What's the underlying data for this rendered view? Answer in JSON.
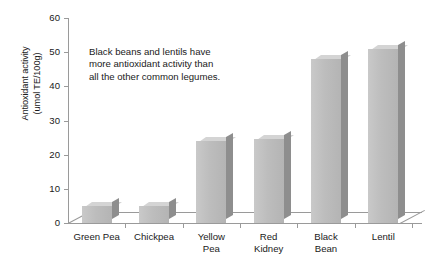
{
  "chart_data": {
    "type": "bar",
    "title": "",
    "xlabel": "",
    "ylabel": "Antioxidant activity\n(umol TE/100g)",
    "categories": [
      "Green Pea",
      "Chickpea",
      "Yellow\nPea",
      "Red\nKidney",
      "Black\nBean",
      "Lentil"
    ],
    "values": [
      5,
      5,
      24,
      24.5,
      48,
      51
    ],
    "ylim": [
      0,
      60
    ],
    "yticks": [
      0,
      10,
      20,
      30,
      40,
      50,
      60
    ],
    "ytick_labels": [
      "0",
      "10",
      "20",
      "30",
      "40",
      "50",
      "60"
    ],
    "grid": false,
    "legend": "none",
    "annotations": [
      "Black beans and lentils have\nmore antioxidant activity than\nall the other common legumes."
    ],
    "style": {
      "bar_face_color": "#bdbdbd",
      "bar_top_color": "#d4d4d4",
      "bar_side_color": "#8e8e8e",
      "axis_color": "#9a9a9a",
      "text_color": "#1a1a1a",
      "background": "#ffffff",
      "three_d": true
    }
  }
}
